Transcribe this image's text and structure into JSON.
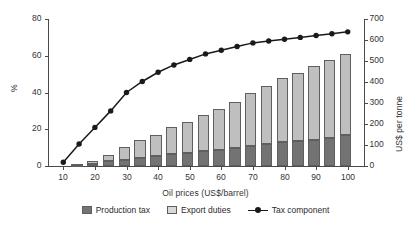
{
  "chart_data": {
    "type": "bar",
    "title": "",
    "xlabel": "Oil prices (US$/barrel)",
    "ylabel": "%",
    "ylabel_secondary": "US$ per tonne",
    "xlim": [
      5,
      105
    ],
    "ylim": [
      0,
      80
    ],
    "ylim_secondary": [
      0,
      700
    ],
    "xticks": [
      10,
      20,
      30,
      40,
      50,
      60,
      70,
      80,
      90,
      100
    ],
    "yticks": [
      0,
      20,
      40,
      60,
      80
    ],
    "yticks_secondary": [
      0,
      100,
      200,
      300,
      400,
      500,
      600,
      700
    ],
    "grid": false,
    "legend_position": "bottom",
    "legend": [
      "Production tax",
      "Export duties",
      "Tax component"
    ],
    "colors": {
      "production_tax": "#737373",
      "export_duties": "#bfbfbf",
      "tax_component": "#1a1a1a",
      "axis": "#4a4a4a",
      "text": "#2b2b2b"
    },
    "bar_x": [
      15,
      20,
      25,
      30,
      35,
      40,
      45,
      50,
      55,
      60,
      65,
      70,
      75,
      80,
      85,
      90,
      95,
      100
    ],
    "series": [
      {
        "name": "Production tax",
        "axis": "secondary",
        "unit": "US$ per tonne",
        "values": [
          2,
          8,
          22,
          30,
          38,
          46,
          55,
          62,
          70,
          78,
          86,
          97,
          105,
          112,
          120,
          126,
          134,
          148
        ]
      },
      {
        "name": "Export duties",
        "axis": "secondary",
        "unit": "US$ per tonne",
        "values": [
          3,
          14,
          31,
          59,
          84,
          104,
          130,
          148,
          175,
          192,
          218,
          250,
          275,
          305,
          325,
          352,
          372,
          387
        ]
      },
      {
        "name": "Tax component",
        "axis": "primary",
        "unit": "%",
        "x": [
          10,
          15,
          20,
          25,
          30,
          35,
          40,
          45,
          50,
          55,
          60,
          65,
          70,
          75,
          80,
          85,
          90,
          95,
          100
        ],
        "values": [
          2,
          12,
          21,
          30,
          40,
          46,
          51,
          55,
          58,
          61,
          63,
          65,
          67,
          68,
          69,
          70,
          71,
          72,
          73
        ]
      }
    ],
    "bar_totals": [
      5,
      22,
      53,
      89,
      122,
      150,
      185,
      210,
      245,
      270,
      304,
      347,
      380,
      417,
      445,
      478,
      506,
      535
    ]
  }
}
